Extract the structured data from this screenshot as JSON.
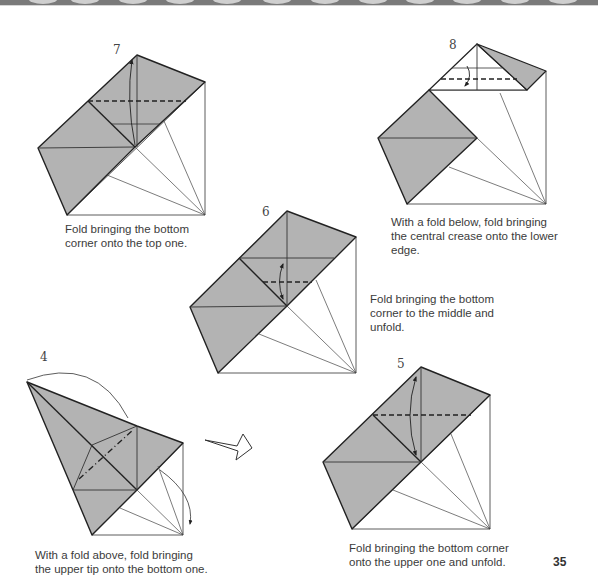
{
  "page": {
    "number": "35",
    "header_band_color": "#7a7a7a",
    "paper_color": "#b3b3b3"
  },
  "steps": [
    {
      "id": "4",
      "number": "4",
      "caption": "With a fold above, fold bringing\nthe upper tip onto the bottom one."
    },
    {
      "id": "5",
      "number": "5",
      "caption": "Fold bringing the bottom corner\nonto the upper one and unfold."
    },
    {
      "id": "6",
      "number": "6",
      "caption": "Fold bringing the bottom\ncorner to the middle and\nunfold."
    },
    {
      "id": "7",
      "number": "7",
      "caption": "Fold bringing the bottom\ncorner onto the top one."
    },
    {
      "id": "8",
      "number": "8",
      "caption": "With a fold below, fold bringing\nthe central crease onto the lower\nedge."
    }
  ],
  "symbols": {
    "turn_over_arrow": "hollow turn-over arrow between step 4 and step 5"
  }
}
